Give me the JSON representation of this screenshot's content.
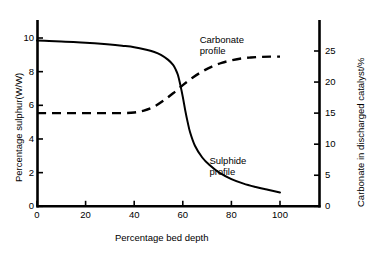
{
  "chart_data": {
    "type": "line",
    "title": "",
    "xlabel": "Percentage bed depth",
    "ylabel": "Percentage sulphur(W/W)",
    "ylabel_right": "Carbonate in discharged catalyst/%",
    "xlim": [
      0,
      100
    ],
    "ylim": [
      0,
      10
    ],
    "ylim_right": [
      0,
      25
    ],
    "xticks": [
      "0",
      "20",
      "40",
      "60",
      "80",
      "100"
    ],
    "xtick_values": [
      0,
      20,
      40,
      60,
      80,
      100
    ],
    "yticks": [
      "0",
      "2",
      "4",
      "6",
      "8",
      "10"
    ],
    "ytick_values": [
      0,
      2,
      4,
      6,
      8,
      10
    ],
    "yticks_right": [
      "0",
      "5",
      "10",
      "15",
      "20",
      "25"
    ],
    "ytick_right_values": [
      0,
      5,
      10,
      15,
      20,
      25
    ],
    "grid": false,
    "legend": "inline-annotations",
    "annotations": [
      {
        "text": "Carbonate\nprofile",
        "x": 76,
        "y": 26.5,
        "axis": "right"
      },
      {
        "text": "Sulphide\nprofile",
        "x": 80,
        "y": 2.6,
        "axis": "left"
      }
    ],
    "series": [
      {
        "name": "Sulphide profile",
        "axis": "left",
        "style": "solid",
        "color": "#000000",
        "x": [
          0,
          5,
          10,
          15,
          20,
          25,
          30,
          35,
          40,
          45,
          48,
          51,
          54,
          56,
          57,
          58,
          59,
          60,
          61,
          62,
          63,
          65,
          68,
          71,
          75,
          80,
          85,
          90,
          95,
          100
        ],
        "y": [
          9.85,
          9.82,
          9.79,
          9.76,
          9.72,
          9.68,
          9.62,
          9.54,
          9.45,
          9.3,
          9.18,
          9.0,
          8.7,
          8.4,
          8.15,
          7.8,
          7.2,
          6.5,
          5.7,
          5.0,
          4.4,
          3.6,
          2.9,
          2.45,
          2.0,
          1.62,
          1.35,
          1.15,
          0.98,
          0.82
        ]
      },
      {
        "name": "Carbonate profile",
        "axis": "right",
        "style": "dashed",
        "color": "#000000",
        "x": [
          0,
          5,
          10,
          15,
          20,
          25,
          30,
          35,
          40,
          44,
          48,
          52,
          56,
          60,
          64,
          68,
          72,
          76,
          80,
          84,
          88,
          92,
          96,
          100
        ],
        "y": [
          15.0,
          15.0,
          15.0,
          15.0,
          15.0,
          15.0,
          15.0,
          15.0,
          15.1,
          15.4,
          16.0,
          17.0,
          18.2,
          19.5,
          20.7,
          21.7,
          22.5,
          23.1,
          23.5,
          23.8,
          23.95,
          24.05,
          24.1,
          24.1
        ]
      }
    ]
  }
}
